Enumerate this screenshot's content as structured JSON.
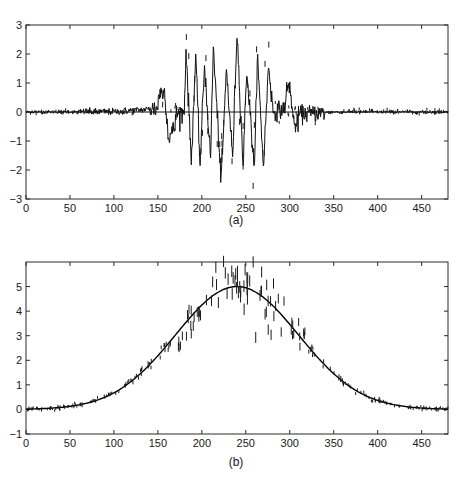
{
  "figure": {
    "panels": [
      {
        "id": "a",
        "caption": "(a)",
        "xticks": [
          "0",
          "50",
          "100",
          "150",
          "200",
          "250",
          "300",
          "350",
          "400",
          "450"
        ],
        "yticks": [
          "-3",
          "-2",
          "-1",
          "0",
          "1",
          "2",
          "3"
        ]
      },
      {
        "id": "b",
        "caption": "(b)",
        "xticks": [
          "0",
          "50",
          "100",
          "150",
          "200",
          "250",
          "300",
          "350",
          "400",
          "450"
        ],
        "yticks": [
          "-1",
          "0",
          "1",
          "2",
          "3",
          "4",
          "5"
        ]
      }
    ]
  },
  "chart_data": [
    {
      "type": "line",
      "title": "",
      "caption": "(a)",
      "xlabel": "",
      "ylabel": "",
      "xlim": [
        0,
        480
      ],
      "ylim": [
        -3,
        3
      ],
      "xticks": [
        0,
        50,
        100,
        150,
        200,
        250,
        300,
        350,
        400,
        450
      ],
      "yticks": [
        -3,
        -2,
        -1,
        0,
        1,
        2,
        3
      ],
      "grid": false,
      "legend": null,
      "series": [
        {
          "name": "noisy windowed oscillation",
          "style": "black solid line with dashed noise marks",
          "description": "Near-zero baseline with small noise from 0 to ~175; a burst of ~10 oscillation cycles (period ~10) between x~180 and x~280 with amplitude ~1.5-2.3 (peak ~2.8 near x~240, trough ~-2.4 near x~222); small residual noise near 300 (~0.9) decaying to ~0 by 480",
          "key_points": [
            {
              "x": 0,
              "y": 0.0
            },
            {
              "x": 100,
              "y": 0.05
            },
            {
              "x": 158,
              "y": 0.7
            },
            {
              "x": 162,
              "y": -0.9
            },
            {
              "x": 180,
              "y": 0.0
            },
            {
              "x": 182,
              "y": 2.2
            },
            {
              "x": 188,
              "y": -1.7
            },
            {
              "x": 193,
              "y": 1.9
            },
            {
              "x": 198,
              "y": -1.85
            },
            {
              "x": 203,
              "y": 1.65
            },
            {
              "x": 210,
              "y": -1.6
            },
            {
              "x": 213,
              "y": 2.25
            },
            {
              "x": 222,
              "y": -2.4
            },
            {
              "x": 228,
              "y": 1.5
            },
            {
              "x": 235,
              "y": -1.6
            },
            {
              "x": 240,
              "y": 2.8
            },
            {
              "x": 247,
              "y": -1.85
            },
            {
              "x": 251,
              "y": 1.5
            },
            {
              "x": 260,
              "y": -2.05
            },
            {
              "x": 263,
              "y": 2.0
            },
            {
              "x": 270,
              "y": -1.85
            },
            {
              "x": 276,
              "y": 1.65
            },
            {
              "x": 281,
              "y": 0.0
            },
            {
              "x": 300,
              "y": 0.9
            },
            {
              "x": 305,
              "y": -0.45
            },
            {
              "x": 350,
              "y": 0.0
            },
            {
              "x": 480,
              "y": 0.0
            }
          ]
        }
      ]
    },
    {
      "type": "line",
      "title": "",
      "caption": "(b)",
      "xlabel": "",
      "ylabel": "",
      "xlim": [
        0,
        480
      ],
      "ylim": [
        -1,
        6
      ],
      "xticks": [
        0,
        50,
        100,
        150,
        200,
        250,
        300,
        350,
        400,
        450
      ],
      "yticks": [
        -1,
        0,
        1,
        2,
        3,
        4,
        5
      ],
      "grid": false,
      "legend": null,
      "series": [
        {
          "name": "gaussian fit",
          "style": "solid black curve",
          "model": {
            "amplitude": 5.0,
            "center": 240,
            "sigma": 70
          },
          "x": [
            0,
            50,
            100,
            150,
            200,
            240,
            250,
            300,
            350,
            400,
            450,
            480
          ],
          "values": [
            0.0,
            0.13,
            0.68,
            2.19,
            4.25,
            5.0,
            4.95,
            3.48,
            1.46,
            0.37,
            0.06,
            0.01
          ]
        },
        {
          "name": "noisy samples",
          "style": "short dashed vertical marks scattered around curve",
          "description": "Noise amplitude grows with signal; largest scatter between x~180 and x~310 (samples reaching ~5.6 near x~255 and ~3.5 near x~215)"
        }
      ]
    }
  ]
}
